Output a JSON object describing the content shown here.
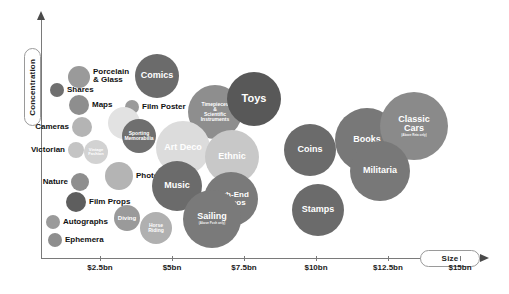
{
  "chart_data": {
    "type": "scatter",
    "title": "",
    "xlabel": "Size",
    "ylabel": "Concentration",
    "grid": false,
    "legend": "none",
    "x_ticks": [
      "$2.5bn",
      "$5bn",
      "$7.5bn",
      "$10bn",
      "$12.5bn",
      "$15bn"
    ],
    "x_tick_positions": [
      100,
      172,
      244,
      316,
      388,
      460
    ],
    "y_ticks": [],
    "note": "Bubble chart of collectables categories: horizontal axis = market Size in $bn, vertical axis = Concentration. Bubble area represents relative market scale.",
    "points": [
      {
        "label": "Shares",
        "sub": "",
        "x": 57,
        "y": 90,
        "r": 7,
        "color": "#6f6f6f",
        "text_color": "#111111",
        "label_position": "right",
        "font_size": 8
      },
      {
        "label": "Porcelain\n& Glass",
        "sub": "",
        "x": 79,
        "y": 77,
        "r": 11,
        "color": "#9a9a9a",
        "text_color": "#111111",
        "label_position": "right",
        "font_size": 8
      },
      {
        "label": "Maps",
        "sub": "",
        "x": 79,
        "y": 105,
        "r": 10,
        "color": "#8e8e8e",
        "text_color": "#111111",
        "label_position": "right",
        "font_size": 8
      },
      {
        "label": "Cameras",
        "sub": "",
        "x": 82,
        "y": 127,
        "r": 10,
        "color": "#b4b4b4",
        "text_color": "#111111",
        "label_position": "left",
        "font_size": 8
      },
      {
        "label": "Victorian",
        "sub": "",
        "x": 76,
        "y": 150,
        "r": 8,
        "color": "#c4c4c4",
        "text_color": "#111111",
        "label_position": "left",
        "font_size": 8
      },
      {
        "label": "Nature",
        "sub": "",
        "x": 80,
        "y": 182,
        "r": 9,
        "color": "#8e8e8e",
        "text_color": "#111111",
        "label_position": "left",
        "font_size": 8
      },
      {
        "label": "Film Props",
        "sub": "",
        "x": 76,
        "y": 202,
        "r": 10,
        "color": "#5e5e5e",
        "text_color": "#111111",
        "label_position": "right",
        "font_size": 8
      },
      {
        "label": "Autographs",
        "sub": "",
        "x": 53,
        "y": 222,
        "r": 7,
        "color": "#9a9a9a",
        "text_color": "#111111",
        "label_position": "right",
        "font_size": 8
      },
      {
        "label": "Ephemera",
        "sub": "",
        "x": 55,
        "y": 240,
        "r": 7,
        "color": "#8e8e8e",
        "text_color": "#111111",
        "label_position": "right",
        "font_size": 8
      },
      {
        "label": "Vintage\nFashion",
        "sub": "",
        "x": 96,
        "y": 152,
        "r": 12,
        "color": "#d2d2d2",
        "text_color": "#ffffff",
        "label_position": "inside",
        "font_size": 4
      },
      {
        "label": "Comics",
        "sub": "",
        "x": 157,
        "y": 76,
        "r": 22,
        "color": "#6b6b6b",
        "text_color": "#ffffff",
        "label_position": "inside",
        "font_size": 9
      },
      {
        "label": "Film Poster",
        "sub": "",
        "x": 132,
        "y": 107,
        "r": 7,
        "color": "#9a9a9a",
        "text_color": "#111111",
        "label_position": "right",
        "font_size": 8
      },
      {
        "label": "",
        "sub": "",
        "x": 124,
        "y": 123,
        "r": 16,
        "color": "#e2e2e2",
        "text_color": "#ffffff",
        "label_position": "inside",
        "font_size": 5
      },
      {
        "label": "Sporting\nMemorabilia",
        "sub": "",
        "x": 139,
        "y": 136,
        "r": 17,
        "color": "#6f6f6f",
        "text_color": "#ffffff",
        "label_position": "inside",
        "font_size": 5
      },
      {
        "label": "Photos",
        "sub": "",
        "x": 119,
        "y": 176,
        "r": 14,
        "color": "#b4b4b4",
        "text_color": "#111111",
        "label_position": "right",
        "font_size": 8
      },
      {
        "label": "Diving",
        "sub": "",
        "x": 127,
        "y": 218,
        "r": 13,
        "color": "#9a9a9a",
        "text_color": "#ffffff",
        "label_position": "inside",
        "font_size": 6
      },
      {
        "label": "Horse\nRiding",
        "sub": "",
        "x": 156,
        "y": 228,
        "r": 16,
        "color": "#b0b0b0",
        "text_color": "#ffffff",
        "label_position": "inside",
        "font_size": 5
      },
      {
        "label": "Timepieces\n&\nScientific\nInstruments",
        "sub": "",
        "x": 215,
        "y": 112,
        "r": 27,
        "color": "#8e8e8e",
        "text_color": "#ffffff",
        "label_position": "inside",
        "font_size": 5
      },
      {
        "label": "Toys",
        "sub": "",
        "x": 254,
        "y": 99,
        "r": 27,
        "color": "#585858",
        "text_color": "#ffffff",
        "label_position": "inside",
        "font_size": 11
      },
      {
        "label": "Art Deco",
        "sub": "",
        "x": 183,
        "y": 148,
        "r": 27,
        "color": "#dcdcdc",
        "text_color": "#ffffff",
        "label_position": "inside",
        "font_size": 9
      },
      {
        "label": "Ethnic",
        "sub": "",
        "x": 232,
        "y": 157,
        "r": 27,
        "color": "#c8c8c8",
        "text_color": "#ffffff",
        "label_position": "inside",
        "font_size": 9
      },
      {
        "label": "Music",
        "sub": "",
        "x": 177,
        "y": 186,
        "r": 25,
        "color": "#6b6b6b",
        "text_color": "#ffffff",
        "label_position": "inside",
        "font_size": 9
      },
      {
        "label": "High-End\nStereos",
        "sub": "",
        "x": 231,
        "y": 199,
        "r": 27,
        "color": "#7a7a7a",
        "text_color": "#ffffff",
        "label_position": "inside",
        "font_size": 8
      },
      {
        "label": "Sailing",
        "sub": "(Above Posh only)",
        "x": 212,
        "y": 219,
        "r": 29,
        "color": "#7a7a7a",
        "text_color": "#ffffff",
        "label_position": "inside",
        "font_size": 9
      },
      {
        "label": "Coins",
        "sub": "",
        "x": 310,
        "y": 150,
        "r": 26,
        "color": "#6b6b6b",
        "text_color": "#ffffff",
        "label_position": "inside",
        "font_size": 9
      },
      {
        "label": "Books",
        "sub": "",
        "x": 367,
        "y": 140,
        "r": 32,
        "color": "#787878",
        "text_color": "#ffffff",
        "label_position": "inside",
        "font_size": 9
      },
      {
        "label": "Classic\nCars",
        "sub": "(Above Reta only)",
        "x": 414,
        "y": 126,
        "r": 34,
        "color": "#8a8a8a",
        "text_color": "#ffffff",
        "label_position": "inside",
        "font_size": 9
      },
      {
        "label": "Militaria",
        "sub": "",
        "x": 380,
        "y": 171,
        "r": 30,
        "color": "#787878",
        "text_color": "#ffffff",
        "label_position": "inside",
        "font_size": 9
      },
      {
        "label": "Stamps",
        "sub": "",
        "x": 318,
        "y": 210,
        "r": 26,
        "color": "#6b6b6b",
        "text_color": "#ffffff",
        "label_position": "inside",
        "font_size": 9
      }
    ]
  },
  "axes": {
    "y_title": "Concentration",
    "x_title": "Size"
  }
}
